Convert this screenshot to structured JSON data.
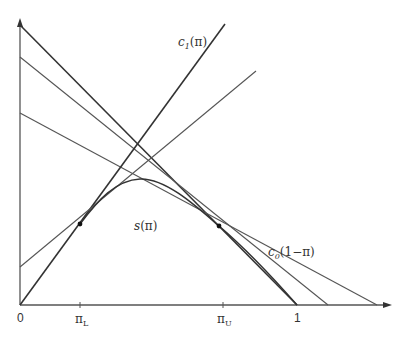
{
  "diagram": {
    "type": "economic-geometric-figure",
    "axes": {
      "origin_label": "0",
      "x_tick_labels": {
        "pi_L": "π",
        "pi_L_sub": "L",
        "pi_U": "π",
        "pi_U_sub": "U",
        "one": "1"
      }
    },
    "labels": {
      "c1": {
        "main": "c",
        "sub": "1",
        "arg": "(π)"
      },
      "c0": {
        "main": "c",
        "sub": "0",
        "arg": "(1−π)"
      },
      "s": {
        "main": "s",
        "arg": "(π)"
      }
    },
    "elements": [
      "vertical axis with arrow",
      "horizontal axis with arrow",
      "c1(pi) rising line from origin",
      "second rising tangent line",
      "three descending lines including c0(1-pi)",
      "concave curve s(pi) with two tangent points at pi_L and pi_U"
    ],
    "colors": {
      "ink": "#333333",
      "background": "#ffffff"
    }
  }
}
